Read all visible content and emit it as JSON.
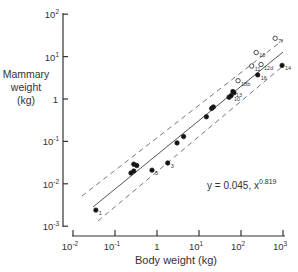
{
  "chart_data": {
    "type": "scatter",
    "title": "",
    "xlabel": "Body weight (kg)",
    "ylabel": [
      "Mammary",
      "weight",
      "(kg)"
    ],
    "xscale": "log",
    "yscale": "log",
    "xlim": [
      0.01,
      1000
    ],
    "ylim": [
      0.001,
      100
    ],
    "x_ticks": [
      {
        "base": "10",
        "exp": "-2"
      },
      {
        "base": "10",
        "exp": "-1"
      },
      {
        "base": "1",
        "exp": ""
      },
      {
        "base": "10",
        "exp": "1"
      },
      {
        "base": "10",
        "exp": "2"
      },
      {
        "base": "10",
        "exp": "3"
      }
    ],
    "y_ticks": [
      {
        "base": "10",
        "exp": "2"
      },
      {
        "base": "10",
        "exp": "1"
      },
      {
        "base": "1",
        "exp": ""
      },
      {
        "base": "10",
        "exp": "-1"
      },
      {
        "base": "10",
        "exp": "-2"
      },
      {
        "base": "10",
        "exp": "-3"
      }
    ],
    "equation": {
      "text": "y = 0.045, x",
      "exp": "0.819"
    },
    "fit": {
      "coefficient": 0.045,
      "exponent": 0.819
    },
    "series": [
      {
        "name": "filled",
        "marker": "filled-circle",
        "points": [
          {
            "x": 0.035,
            "y": 0.0024,
            "label": "1"
          },
          {
            "x": 0.24,
            "y": 0.018,
            "label": ""
          },
          {
            "x": 0.28,
            "y": 0.02,
            "label": ""
          },
          {
            "x": 0.28,
            "y": 0.029,
            "label": ""
          },
          {
            "x": 0.33,
            "y": 0.027,
            "label": ""
          },
          {
            "x": 0.76,
            "y": 0.021,
            "label": "5"
          },
          {
            "x": 1.8,
            "y": 0.031,
            "label": "3"
          },
          {
            "x": 3.0,
            "y": 0.092,
            "label": ""
          },
          {
            "x": 4.3,
            "y": 0.13,
            "label": ""
          },
          {
            "x": 15,
            "y": 0.38,
            "label": ""
          },
          {
            "x": 20,
            "y": 0.6,
            "label": ""
          },
          {
            "x": 22,
            "y": 0.65,
            "label": ""
          },
          {
            "x": 52,
            "y": 1.1,
            "label": ""
          },
          {
            "x": 68,
            "y": 1.4,
            "label": ""
          },
          {
            "x": 64,
            "y": 1.5,
            "label": "13"
          },
          {
            "x": 58,
            "y": 1.2,
            "label": "10"
          },
          {
            "x": 250,
            "y": 3.7,
            "label": "16"
          },
          {
            "x": 950,
            "y": 6.2,
            "label": "14"
          }
        ]
      },
      {
        "name": "open",
        "marker": "open-circle",
        "points": [
          {
            "x": 85,
            "y": 2.7,
            "label": "18b"
          },
          {
            "x": 180,
            "y": 6.0,
            "label": "11"
          },
          {
            "x": 230,
            "y": 12.5,
            "label": "18"
          },
          {
            "x": 300,
            "y": 6.5,
            "label": "12d"
          },
          {
            "x": 650,
            "y": 27,
            "label": "7f"
          }
        ]
      }
    ],
    "legend": null,
    "grid": false
  }
}
